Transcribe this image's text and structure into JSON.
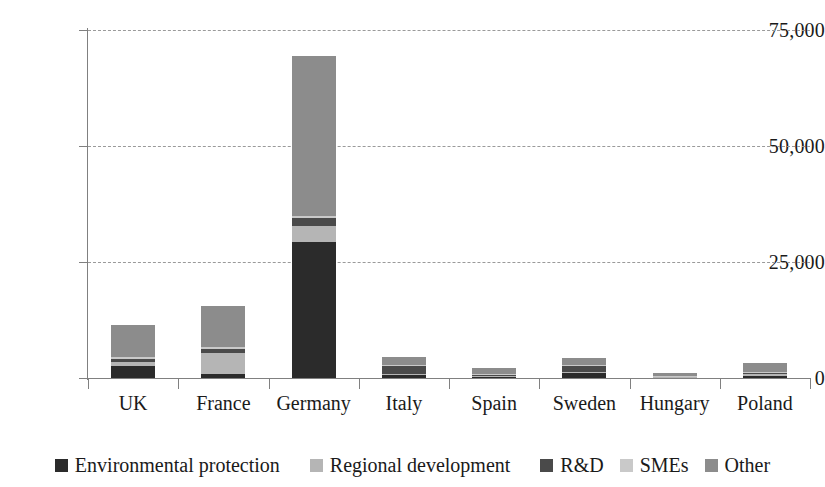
{
  "chart_data": {
    "type": "bar",
    "subtype": "stacked-bar",
    "title": "",
    "xlabel": "",
    "ylabel": "",
    "ylim": [
      0,
      75000
    ],
    "yticks": [
      0,
      25000,
      50000,
      75000
    ],
    "ytick_labels": [
      "0",
      "25,000",
      "50,000",
      "75,000"
    ],
    "grid": "horizontal-dashed",
    "legend_position": "bottom",
    "categories": [
      "UK",
      "France",
      "Germany",
      "Italy",
      "Spain",
      "Sweden",
      "Hungary",
      "Poland"
    ],
    "series": [
      {
        "name": "Environmental protection",
        "color": "#2b2b2b",
        "values": [
          2600,
          900,
          29400,
          600,
          200,
          1100,
          200,
          500
        ]
      },
      {
        "name": "Regional development",
        "color": "#b5b5b5",
        "values": [
          900,
          4400,
          3300,
          300,
          200,
          300,
          100,
          300
        ]
      },
      {
        "name": "R&D",
        "color": "#4a4a4a",
        "values": [
          700,
          1000,
          1700,
          1700,
          300,
          1200,
          100,
          200
        ]
      },
      {
        "name": "SMEs",
        "color": "#c9c9c9",
        "values": [
          400,
          300,
          500,
          200,
          100,
          200,
          100,
          200
        ]
      },
      {
        "name": "Other",
        "color": "#8c8c8c",
        "values": [
          6900,
          8900,
          34600,
          1700,
          1400,
          1600,
          500,
          2000
        ]
      }
    ],
    "totals": [
      11500,
      15500,
      69500,
      4500,
      2200,
      4400,
      1000,
      3200
    ]
  },
  "legend": {
    "items": [
      {
        "label": "Environmental protection",
        "color": "#2b2b2b"
      },
      {
        "label": "Regional development",
        "color": "#b5b5b5"
      },
      {
        "label": "R&D",
        "color": "#4a4a4a"
      },
      {
        "label": "SMEs",
        "color": "#c9c9c9"
      },
      {
        "label": "Other",
        "color": "#8c8c8c"
      }
    ]
  },
  "axis": {
    "y_tick_labels": [
      "75,000",
      "50,000",
      "25,000",
      "0"
    ],
    "x_tick_labels": [
      "UK",
      "France",
      "Germany",
      "Italy",
      "Spain",
      "Sweden",
      "Hungary",
      "Poland"
    ]
  },
  "colors": {
    "grid": "#9a9a9a",
    "axis": "#808080",
    "text": "#1a1a1a",
    "background": "#ffffff"
  }
}
